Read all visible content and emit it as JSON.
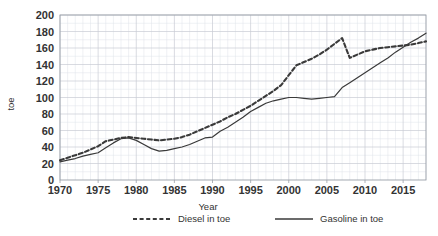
{
  "chart_data": {
    "type": "line",
    "title": "",
    "xlabel": "Year",
    "ylabel": "toe",
    "xlim": [
      1970,
      2018
    ],
    "ylim": [
      0,
      200
    ],
    "grid": true,
    "legend_position": "bottom",
    "x_ticks": [
      "1970",
      "1975",
      "1980",
      "1985",
      "1990",
      "1995",
      "2000",
      "2005",
      "2010",
      "2015"
    ],
    "x_tick_values": [
      1970,
      1975,
      1980,
      1985,
      1990,
      1995,
      2000,
      2005,
      2010,
      2015
    ],
    "y_ticks": [
      "0",
      "20",
      "40",
      "60",
      "80",
      "100",
      "120",
      "140",
      "160",
      "180",
      "200"
    ],
    "y_tick_values": [
      0,
      20,
      40,
      60,
      80,
      100,
      120,
      140,
      160,
      180,
      200
    ],
    "x": [
      1970,
      1971,
      1972,
      1973,
      1974,
      1975,
      1976,
      1977,
      1978,
      1979,
      1980,
      1981,
      1982,
      1983,
      1984,
      1985,
      1986,
      1987,
      1988,
      1989,
      1990,
      1991,
      1992,
      1993,
      1994,
      1995,
      1996,
      1997,
      1998,
      1999,
      2000,
      2001,
      2002,
      2003,
      2004,
      2005,
      2006,
      2007,
      2008,
      2009,
      2010,
      2011,
      2012,
      2013,
      2014,
      2015,
      2016,
      2017,
      2018
    ],
    "series": [
      {
        "name": "Diesel in toe",
        "style": "dashed",
        "color": "#3a3a3a",
        "values": [
          24,
          27,
          30,
          33,
          37,
          41,
          47,
          49,
          51,
          52,
          51,
          50,
          49,
          48,
          49,
          50,
          52,
          55,
          59,
          63,
          67,
          71,
          76,
          80,
          85,
          90,
          96,
          102,
          108,
          115,
          127,
          139,
          143,
          147,
          152,
          158,
          165,
          172,
          148,
          152,
          156,
          158,
          160,
          161,
          162,
          163,
          164,
          166,
          168
        ]
      },
      {
        "name": "Gasoline in toe",
        "style": "solid",
        "color": "#5a5a5a",
        "values": [
          22,
          24,
          26,
          29,
          31,
          33,
          39,
          45,
          50,
          51,
          48,
          43,
          38,
          35,
          36,
          38,
          40,
          43,
          47,
          51,
          52,
          59,
          64,
          70,
          76,
          83,
          88,
          93,
          96,
          98,
          100,
          100,
          99,
          98,
          99,
          100,
          101,
          112,
          118,
          124,
          130,
          136,
          142,
          148,
          155,
          161,
          167,
          172,
          178
        ]
      }
    ]
  },
  "legend": {
    "items": [
      {
        "label": "Diesel in toe",
        "style": "dashed"
      },
      {
        "label": "Gasoline in toe",
        "style": "solid"
      }
    ]
  },
  "axis": {
    "y_label": "toe",
    "x_label": "Year"
  }
}
